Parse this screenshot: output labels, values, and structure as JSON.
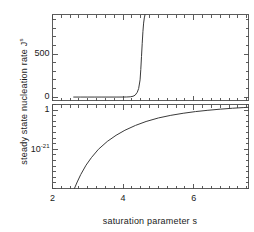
{
  "figure": {
    "xlabel": "saturation parameter s",
    "ylabel_main": "steady state nucleation rate J",
    "ylabel_sup": "s",
    "line_color": "#3a3a3a",
    "axis_color": "#4a4a4a",
    "background": "#ffffff"
  },
  "axes": {
    "x": {
      "min": 2.0,
      "max": 7.55,
      "ticks_major": [
        2,
        4,
        6
      ],
      "tick_labels": [
        "2",
        "4",
        "6"
      ],
      "minor_step": 0.25
    },
    "upper_y": {
      "scale": "linear",
      "min": -40,
      "max": 960,
      "ticks_major": [
        0,
        500
      ],
      "tick_labels": [
        "0",
        "500"
      ],
      "minor_step": 100
    },
    "lower_y": {
      "scale": "log",
      "min_exp": -42,
      "max_exp": 3,
      "ticks_major_exp": [
        0,
        -21
      ],
      "tick_labels": [
        "1",
        "10"
      ],
      "tick_label_exponents": [
        "",
        "-21"
      ],
      "minor_decade_step": 3
    }
  },
  "chart_data": {
    "type": "line",
    "title": "",
    "xlabel": "saturation parameter s",
    "ylabel": "steady state nucleation rate J^s",
    "grid": false,
    "legend": "none",
    "panels": [
      {
        "name": "upper-linear-panel",
        "yscale": "linear",
        "xlim": [
          2.0,
          7.55
        ],
        "ylim": [
          -40,
          960
        ],
        "ytick_values": [
          0,
          500
        ],
        "ytick_labels": [
          "0",
          "500"
        ],
        "series": [
          {
            "name": "steady state nucleation rate",
            "x": [
              2.6,
              2.8,
              3.0,
              3.2,
              3.4,
              3.6,
              3.8,
              4.0,
              4.1,
              4.2,
              4.28,
              4.34,
              4.4,
              4.44,
              4.48,
              4.5,
              4.52,
              4.54,
              4.56,
              4.58,
              4.6,
              4.62
            ],
            "y": [
              0,
              0,
              0,
              0,
              0,
              0,
              0,
              0.2,
              0.8,
              3,
              9,
              22,
              55,
              100,
              200,
              320,
              470,
              620,
              760,
              860,
              920,
              960
            ]
          }
        ]
      },
      {
        "name": "lower-log-panel",
        "yscale": "log",
        "xlim": [
          2.0,
          7.55
        ],
        "ylim_exp": [
          -42,
          3
        ],
        "ytick_exponents": [
          0,
          -21
        ],
        "ytick_labels": [
          "1",
          "10^-21"
        ],
        "series": [
          {
            "name": "steady state nucleation rate (log)",
            "x": [
              2.62,
              2.7,
              2.8,
              2.95,
              3.1,
              3.3,
              3.55,
              3.8,
              4.05,
              4.35,
              4.65,
              5.0,
              5.35,
              5.7,
              6.05,
              6.4,
              6.75,
              7.1,
              7.4,
              7.55
            ],
            "y_exp": [
              -42,
              -38.5,
              -34.5,
              -29.5,
              -25.5,
              -21.0,
              -16.8,
              -13.5,
              -10.8,
              -8.2,
              -6.1,
              -4.2,
              -2.8,
              -1.7,
              -0.8,
              -0.1,
              0.5,
              1.0,
              1.35,
              1.5
            ]
          }
        ]
      }
    ]
  }
}
